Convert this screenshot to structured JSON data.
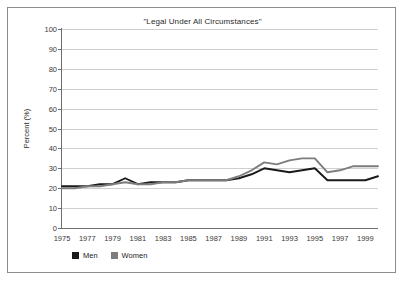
{
  "chart_data": {
    "type": "line",
    "title": "\"Legal Under All Circumstances\"",
    "xlabel": "",
    "ylabel": "Percent (%)",
    "ylim": [
      0,
      100
    ],
    "ytick_step": 10,
    "yticks": [
      100,
      90,
      80,
      70,
      60,
      50,
      40,
      30,
      20,
      10,
      0
    ],
    "xlim": [
      1975,
      2000
    ],
    "xticks": [
      1975,
      1977,
      1979,
      1981,
      1983,
      1985,
      1987,
      1989,
      1991,
      1993,
      1995,
      1997,
      1999
    ],
    "grid": "horizontal",
    "legend_position": "below-left",
    "x": [
      1975,
      1976,
      1977,
      1978,
      1979,
      1980,
      1981,
      1982,
      1983,
      1984,
      1985,
      1986,
      1987,
      1988,
      1989,
      1990,
      1991,
      1992,
      1993,
      1994,
      1995,
      1996,
      1997,
      1998,
      1999,
      2000
    ],
    "series": [
      {
        "name": "Men",
        "color": "#1a1a1a",
        "values": [
          21,
          21,
          21,
          22,
          22,
          25,
          22,
          23,
          23,
          23,
          24,
          24,
          24,
          24,
          25,
          27,
          30,
          29,
          28,
          29,
          30,
          24,
          24,
          24,
          24,
          26
        ]
      },
      {
        "name": "Women",
        "color": "#7d7d7d",
        "values": [
          20,
          20,
          21,
          21,
          22,
          23,
          22,
          22,
          23,
          23,
          24,
          24,
          24,
          24,
          26,
          29,
          33,
          32,
          34,
          35,
          35,
          28,
          29,
          31,
          31,
          31
        ]
      }
    ]
  },
  "legend": {
    "items": [
      {
        "label": "Men",
        "color": "#1a1a1a"
      },
      {
        "label": "Women",
        "color": "#7d7d7d"
      }
    ]
  }
}
